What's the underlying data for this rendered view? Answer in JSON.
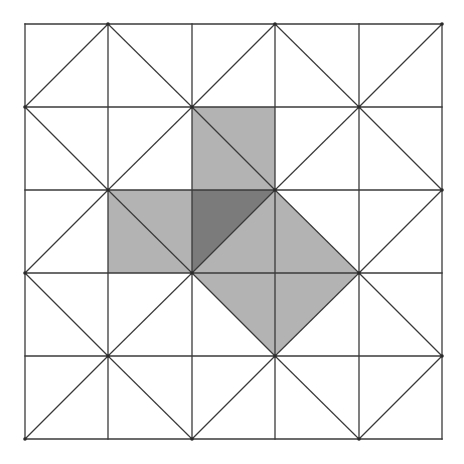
{
  "diagram": {
    "type": "triangulated-square-grid",
    "title": "",
    "rows": 5,
    "cols": 5,
    "origin": {
      "x": 25,
      "y": 24
    },
    "x_lines": [
      25,
      108,
      192,
      275,
      359,
      442
    ],
    "y_lines": [
      24,
      107,
      190,
      273,
      356,
      439
    ],
    "diagonal_rule": "cell (row, col): '/' if (row+col) even, '\\' if odd",
    "colors": {
      "background": "#ffffff",
      "line": "#3a3a3a",
      "light_shade": "#b3b3b3",
      "dark_shade": "#7b7b7b"
    },
    "shaded_regions": [
      {
        "name": "top-cell-full",
        "shade": "light",
        "points": [
          [
            192,
            107
          ],
          [
            275,
            107
          ],
          [
            275,
            190
          ],
          [
            192,
            190
          ]
        ]
      },
      {
        "name": "left-cell-full",
        "shade": "light",
        "points": [
          [
            108,
            190
          ],
          [
            192,
            190
          ],
          [
            192,
            273
          ],
          [
            108,
            273
          ]
        ]
      },
      {
        "name": "center-upper-left-triangle",
        "shade": "dark",
        "points": [
          [
            192,
            190
          ],
          [
            275,
            190
          ],
          [
            192,
            273
          ]
        ]
      },
      {
        "name": "center-lower-right-triangle",
        "shade": "light",
        "points": [
          [
            275,
            190
          ],
          [
            275,
            273
          ],
          [
            192,
            273
          ]
        ]
      },
      {
        "name": "right-cell-lower-left-triangle",
        "shade": "light",
        "points": [
          [
            275,
            190
          ],
          [
            359,
            273
          ],
          [
            275,
            273
          ]
        ]
      },
      {
        "name": "below-cell-upper-right-triangle",
        "shade": "light",
        "points": [
          [
            192,
            273
          ],
          [
            275,
            273
          ],
          [
            275,
            356
          ]
        ]
      },
      {
        "name": "below-right-cell-upper-left-triangle",
        "shade": "light",
        "points": [
          [
            275,
            273
          ],
          [
            359,
            273
          ],
          [
            275,
            356
          ]
        ]
      }
    ]
  }
}
